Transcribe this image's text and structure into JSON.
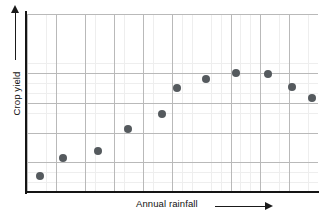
{
  "chart_data": {
    "type": "scatter",
    "title": "",
    "subtitle": "",
    "xlabel": "Annual rainfall",
    "ylabel": "Crop yield",
    "xlabel_arrow": "→",
    "ylabel_arrow": "↑",
    "xtick_labels": [],
    "ytick_labels": [],
    "xlim": [
      0,
      1
    ],
    "ylim": [
      0,
      1
    ],
    "grid": true,
    "grid_major_color": "#b9b9b9",
    "grid_minor_color": "#eeeeee",
    "axis_color": "#141414",
    "marker_color": "#555a5e",
    "marker_shape": "circle",
    "marker_size_px": 8,
    "legend": null,
    "legend_position": "none",
    "annotations": [],
    "points": [
      {
        "label": "point-1",
        "x": 0.045,
        "y": 0.09
      },
      {
        "label": "point-2",
        "x": 0.124,
        "y": 0.191
      },
      {
        "label": "point-3",
        "x": 0.244,
        "y": 0.23
      },
      {
        "label": "point-4",
        "x": 0.347,
        "y": 0.354
      },
      {
        "label": "point-5",
        "x": 0.464,
        "y": 0.438
      },
      {
        "label": "point-6",
        "x": 0.515,
        "y": 0.584
      },
      {
        "label": "point-7",
        "x": 0.615,
        "y": 0.635
      },
      {
        "label": "point-8",
        "x": 0.718,
        "y": 0.669
      },
      {
        "label": "point-9",
        "x": 0.828,
        "y": 0.663
      },
      {
        "label": "point-10",
        "x": 0.911,
        "y": 0.59
      },
      {
        "label": "point-11",
        "x": 0.979,
        "y": 0.528
      }
    ]
  },
  "figure": {
    "background_color": "#ffffff",
    "width_px": 328,
    "height_px": 218
  }
}
